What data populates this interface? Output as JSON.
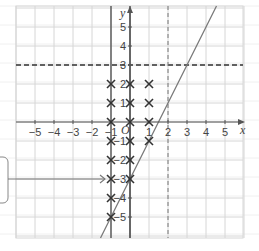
{
  "diagram": {
    "type": "coordinate-grid",
    "axes": {
      "x_label": "x",
      "y_label": "y",
      "origin_label": "O",
      "x_ticks": [
        "−5",
        "−4",
        "−3",
        "−2",
        "−1",
        "1",
        "2",
        "3",
        "4",
        "5"
      ],
      "y_ticks": [
        "5",
        "4",
        "3",
        "2",
        "1",
        "−1",
        "−2",
        "−3",
        "−4",
        "−5"
      ],
      "x_range": [
        -6,
        6
      ],
      "y_range": [
        -6,
        6
      ]
    },
    "lines": [
      {
        "name": "y = 3",
        "style": "dashed",
        "orientation": "horizontal",
        "value": 3
      },
      {
        "name": "x = 2",
        "style": "dashed",
        "orientation": "vertical",
        "value": 2
      },
      {
        "name": "y = 2x − 3",
        "style": "solid",
        "slope": 2,
        "intercept": -3
      },
      {
        "name": "x = −1",
        "style": "solid",
        "orientation": "vertical",
        "value": -1
      },
      {
        "name": "x = 0",
        "style": "solid",
        "orientation": "vertical",
        "value": 0
      }
    ],
    "points": [
      [
        -1,
        2
      ],
      [
        -1,
        1
      ],
      [
        -1,
        0
      ],
      [
        -1,
        -1
      ],
      [
        -1,
        -2
      ],
      [
        -1,
        -3
      ],
      [
        -1,
        -4
      ],
      [
        -1,
        -5
      ],
      [
        0,
        2
      ],
      [
        0,
        1
      ],
      [
        0,
        0
      ],
      [
        0,
        -1
      ],
      [
        0,
        -2
      ],
      [
        0,
        -3
      ],
      [
        1,
        2
      ],
      [
        1,
        1
      ],
      [
        1,
        0
      ],
      [
        1,
        -1
      ]
    ],
    "callout": {
      "text": "",
      "points_to": [
        -1,
        -3
      ]
    },
    "colors": {
      "grid": "#d6d6d6",
      "axis": "#555555",
      "line": "#777777",
      "marker": "#333333"
    }
  }
}
